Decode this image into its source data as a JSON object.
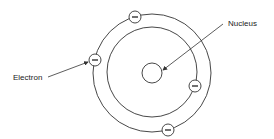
{
  "diagram": {
    "labels": {
      "electron": "Electron",
      "nucleus": "Nucleus"
    },
    "electron_symbol": "−",
    "colors": {
      "stroke": "#333333",
      "text": "#222222",
      "background": "#ffffff"
    }
  }
}
